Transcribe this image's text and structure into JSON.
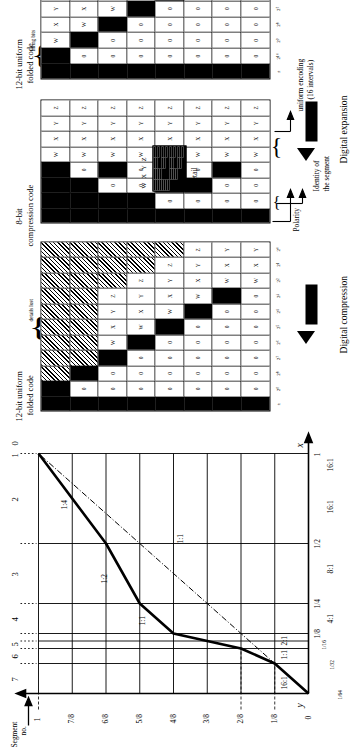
{
  "figure": {
    "arrows": [
      {
        "label": "Digital compression"
      },
      {
        "label": "Digital expansion"
      }
    ]
  },
  "graph": {
    "y_axis_label": "y",
    "x_axis_label": "x",
    "segment_caption_line1": "Segment",
    "segment_caption_line2": "no.",
    "segment_numbers": [
      "7",
      "6",
      "5",
      "4",
      "3",
      "2",
      "1",
      "0"
    ],
    "y_ticks": [
      "1",
      "7/8",
      "6/8",
      "5/8",
      "4/8",
      "3/8",
      "2/8",
      "1/8",
      "0"
    ],
    "x_ticks": [
      "1",
      "1/2",
      "1/4",
      "1/8",
      "1/16",
      "1/32",
      "1/64"
    ],
    "slope_labels_upper": [
      "1:4",
      "1:2",
      "1:1",
      "1:1"
    ],
    "slope_labels_lower": [
      "16:1",
      "1:1",
      "2:1",
      "4:1",
      "8:1",
      "16:1",
      "16:1"
    ],
    "diagonal_label": "1:1"
  },
  "chart_data": {
    "type": "line",
    "xlabel": "x",
    "ylabel": "y",
    "xlim": [
      0,
      1
    ],
    "ylim": [
      0,
      1
    ],
    "grid": true,
    "legend": "none",
    "x_tick_values": [
      0.015625,
      0.03125,
      0.0625,
      0.125,
      0.25,
      0.5,
      1
    ],
    "x_tick_labels": [
      "1/64",
      "1/32",
      "1/16",
      "1/8",
      "1/4",
      "1/2",
      "1"
    ],
    "y_tick_values": [
      0,
      0.125,
      0.25,
      0.375,
      0.5,
      0.625,
      0.75,
      0.875,
      1
    ],
    "y_tick_labels": [
      "0",
      "1/8",
      "2/8",
      "3/8",
      "4/8",
      "5/8",
      "6/8",
      "7/8",
      "1"
    ],
    "series": [
      {
        "name": "Compression characteristic",
        "x": [
          0,
          0.015625,
          0.03125,
          0.0625,
          0.125,
          0.25,
          0.5,
          1
        ],
        "y": [
          0,
          0.125,
          0.25,
          0.375,
          0.5,
          0.625,
          0.75,
          1.0
        ]
      },
      {
        "name": "1:1 reference diagonal",
        "x": [
          0,
          1
        ],
        "y": [
          0,
          1
        ]
      }
    ],
    "segment_slopes": [
      "16:1",
      "16:1",
      "8:1",
      "4:1",
      "2:1",
      "1:1",
      "1:2",
      "1:4"
    ],
    "annotations": [
      "1:4",
      "1:2",
      "1:1",
      "2:1",
      "4:1",
      "8:1",
      "16:1",
      "16:1",
      "1:1"
    ]
  },
  "tables": {
    "left": {
      "title_line1": "12-bit uniform",
      "title_line2": "folded code",
      "brace_label": "details lost",
      "bit_header": "± 2⁹ 2⁸ 2⁷ 2⁶ 2⁵ 2⁴ 2³ 2² 2¹ 2⁰",
      "bits": [
        "±",
        "2⁹",
        "2⁸",
        "2⁷",
        "2⁶",
        "2⁵",
        "2⁴",
        "2³",
        "2²",
        "2¹",
        "2⁰"
      ],
      "rows": [
        [
          "pol",
          "1",
          "hatch",
          "hatch",
          "hatch",
          "hatch",
          "hatch",
          "hatch",
          "hatch",
          "hatch",
          "hatch"
        ],
        [
          "pol",
          "0",
          "1",
          "hatch",
          "hatch",
          "hatch",
          "hatch",
          "hatch",
          "hatch",
          "hatch",
          "hatch"
        ],
        [
          "pol",
          "0",
          "0",
          "1",
          "W",
          "X",
          "Y",
          "Z",
          "hatch",
          "hatch",
          "hatch"
        ],
        [
          "pol",
          "0",
          "0",
          "0",
          "1",
          "W",
          "X",
          "Y",
          "Z",
          "hatch",
          "hatch"
        ],
        [
          "pol",
          "0",
          "0",
          "0",
          "0",
          "1",
          "W",
          "X",
          "Y",
          "Z",
          "hatch"
        ],
        [
          "pol",
          "0",
          "0",
          "0",
          "0",
          "0",
          "1",
          "W",
          "X",
          "Y",
          "Z"
        ],
        [
          "pol",
          "0",
          "0",
          "0",
          "0",
          "0",
          "0",
          "1",
          "W",
          "X",
          "Y",
          "Z"
        ],
        [
          "pol",
          "0",
          "0",
          "0",
          "0",
          "0",
          "0",
          "0",
          "W",
          "X",
          "Y",
          "Z"
        ]
      ]
    },
    "middle": {
      "title_line1": "8-bit",
      "title_line2": "compression code",
      "rows": [
        [
          "pol",
          "1",
          "1",
          "1",
          "W",
          "X",
          "Y",
          "Z"
        ],
        [
          "pol",
          "1",
          "1",
          "0",
          "W",
          "X",
          "Y",
          "Z"
        ],
        [
          "pol",
          "1",
          "0",
          "1",
          "W",
          "X",
          "Y",
          "Z"
        ],
        [
          "pol",
          "1",
          "0",
          "0",
          "W",
          "X",
          "Y",
          "Z"
        ],
        [
          "pol",
          "0",
          "1",
          "1",
          "W",
          "X",
          "Y",
          "Z"
        ],
        [
          "pol",
          "0",
          "1",
          "0",
          "W",
          "X",
          "Y",
          "Z"
        ],
        [
          "pol",
          "0",
          "0",
          "1",
          "W",
          "X",
          "Y",
          "Z"
        ],
        [
          "pol",
          "0",
          "0",
          "0",
          "W",
          "X",
          "Y",
          "Z"
        ]
      ]
    },
    "right": {
      "title_line1": "12-bit uniform",
      "title_line2": "folded code",
      "brace_label": "filling bits",
      "bits": [
        "±",
        "2¹⁰",
        "2⁹",
        "2⁸",
        "2⁷",
        "2⁶",
        "2⁵",
        "2⁴",
        "2³",
        "2²",
        "2¹",
        "2⁰"
      ],
      "rows": [
        [
          "pol",
          "1",
          "W",
          "X",
          "Y",
          "Z",
          "1",
          "0",
          "0",
          "0",
          "0",
          "0"
        ],
        [
          "pol",
          "0",
          "1",
          "W",
          "X",
          "Y",
          "Z",
          "1",
          "0",
          "0",
          "0",
          "0"
        ],
        [
          "pol",
          "0",
          "0",
          "1",
          "W",
          "X",
          "Y",
          "Z",
          "1",
          "0",
          "0",
          "0"
        ],
        [
          "pol",
          "0",
          "0",
          "0",
          "1",
          "W",
          "X",
          "Y",
          "Z",
          "1",
          "0",
          "0"
        ],
        [
          "pol",
          "0",
          "0",
          "0",
          "0",
          "1",
          "W",
          "X",
          "Y",
          "Z",
          "1",
          "0"
        ],
        [
          "pol",
          "0",
          "0",
          "0",
          "0",
          "0",
          "1",
          "W",
          "X",
          "Y",
          "Z",
          "1"
        ],
        [
          "pol",
          "0",
          "0",
          "0",
          "0",
          "0",
          "0",
          "W",
          "X",
          "Y",
          "Z",
          "1"
        ],
        [
          "pol",
          "0",
          "0",
          "0",
          "0",
          "0",
          "0",
          "0",
          "W",
          "X",
          "Y",
          "Z"
        ]
      ]
    }
  },
  "callouts": {
    "polarity": "Polarity",
    "segment_identity_line1": "Identity of",
    "segment_identity_line2": "the segment",
    "uniform_encoding_line1": "uniform encoding",
    "uniform_encoding_line2": "(16 intervals)",
    "detail_label": "Detail",
    "detail_bits": "W X Y Z"
  }
}
